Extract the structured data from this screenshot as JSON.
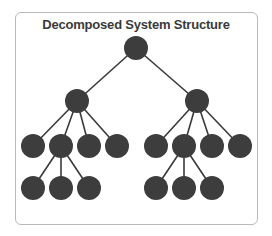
{
  "title": "Decomposed System Structure",
  "colors": {
    "node": "#3d3d3d",
    "edge": "#3a3a3a",
    "frame": "#b9b9b9"
  },
  "tree": {
    "root": {
      "cx": 136,
      "cy": 48
    },
    "children": [
      {
        "cx": 77,
        "cy": 101,
        "children": [
          {
            "cx": 33,
            "cy": 146
          },
          {
            "cx": 61,
            "cy": 146,
            "children": [
              {
                "cx": 33,
                "cy": 188
              },
              {
                "cx": 61,
                "cy": 188
              },
              {
                "cx": 89,
                "cy": 188
              }
            ]
          },
          {
            "cx": 89,
            "cy": 146
          },
          {
            "cx": 117,
            "cy": 146
          }
        ]
      },
      {
        "cx": 197,
        "cy": 101,
        "children": [
          {
            "cx": 156,
            "cy": 146
          },
          {
            "cx": 184,
            "cy": 146,
            "children": [
              {
                "cx": 156,
                "cy": 188
              },
              {
                "cx": 184,
                "cy": 188
              },
              {
                "cx": 212,
                "cy": 188
              }
            ]
          },
          {
            "cx": 212,
            "cy": 146
          },
          {
            "cx": 240,
            "cy": 146
          }
        ]
      }
    ]
  },
  "node_radius": 12
}
